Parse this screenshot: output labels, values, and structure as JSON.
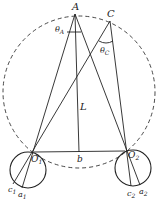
{
  "diagram": {
    "labels": {
      "A": "A",
      "C": "C",
      "theta_A": "θ",
      "theta_A_sub": "A",
      "theta_C": "θ",
      "theta_C_sub": "C",
      "L": "L",
      "b": "b",
      "O1": "O",
      "O1_sub": "1",
      "O2": "O",
      "O2_sub": "2",
      "c1": "c",
      "c1_sub": "1",
      "a1": "a",
      "a1_sub": "1",
      "c2": "c",
      "c2_sub": "2",
      "a2": "a",
      "a2_sub": "2"
    },
    "colors": {
      "stroke": "#222222",
      "background": "#ffffff"
    }
  }
}
